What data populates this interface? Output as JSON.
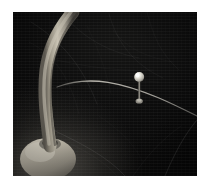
{
  "scene": {
    "title": "Dark photograph of a curved pale lamp stem and a pin on a wire",
    "background_color": "#0b0b0a",
    "border_color": "#ffffff",
    "subjects": [
      {
        "name": "curved-stem",
        "description": "Pale tan curved stem rising from a rounded base at lower left",
        "color": "#b8b2a4"
      },
      {
        "name": "round-base",
        "description": "Rounded dome base at bottom left",
        "color": "#cfc9bb"
      },
      {
        "name": "wire",
        "description": "Thin pale wire curving across the middle of the frame",
        "color": "#8d8a82"
      },
      {
        "name": "pin-marker",
        "description": "Pin with bright spherical head standing on the wire",
        "head_color": "#e8e6de",
        "shaft_color": "#7d7a73"
      }
    ],
    "photo": {
      "left": 13,
      "top": 12,
      "width": 184,
      "height": 164
    }
  }
}
